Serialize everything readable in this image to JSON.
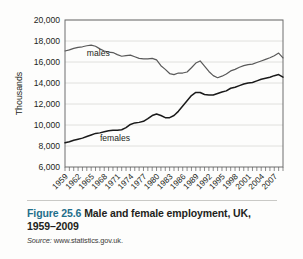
{
  "figure": {
    "number": "Figure 25.6",
    "title": "Male and female employment, UK, 1959–2009",
    "source_label": "Source:",
    "source_value": "www.statistics.gov.uk.",
    "accent_color": "#1f6f8b"
  },
  "chart_data": {
    "type": "line",
    "title": "",
    "xlabel": "",
    "ylabel": "Thousands",
    "ylim": [
      6000,
      20000
    ],
    "ytick_step": 2000,
    "ytick_labels": [
      "6,000",
      "8,000",
      "10,000",
      "12,000",
      "14,000",
      "16,000",
      "18,000",
      "20,000"
    ],
    "ytick_values": [
      6000,
      8000,
      10000,
      12000,
      14000,
      16000,
      18000,
      20000
    ],
    "xlim": [
      1959,
      2009
    ],
    "xtick_labels": [
      "1959",
      "1962",
      "1965",
      "1968",
      "1971",
      "1974",
      "1977",
      "1980",
      "1983",
      "1986",
      "1989",
      "1992",
      "1995",
      "1998",
      "2001",
      "2004",
      "2007"
    ],
    "xtick_values": [
      1959,
      1962,
      1965,
      1968,
      1971,
      1974,
      1977,
      1980,
      1983,
      1986,
      1989,
      1992,
      1995,
      1998,
      2001,
      2004,
      2007
    ],
    "xtick_minor_step": 1,
    "grid": "horizontal",
    "legend": "inline-annotations",
    "annotations": [
      {
        "text": "males",
        "x": 1964,
        "y": 16550
      },
      {
        "text": "females",
        "x": 1967,
        "y": 8450
      }
    ],
    "x": [
      1959,
      1960,
      1961,
      1962,
      1963,
      1964,
      1965,
      1966,
      1967,
      1968,
      1969,
      1970,
      1971,
      1972,
      1973,
      1974,
      1975,
      1976,
      1977,
      1978,
      1979,
      1980,
      1981,
      1982,
      1983,
      1984,
      1985,
      1986,
      1987,
      1988,
      1989,
      1990,
      1991,
      1992,
      1993,
      1994,
      1995,
      1996,
      1997,
      1998,
      1999,
      2000,
      2001,
      2002,
      2003,
      2004,
      2005,
      2006,
      2007,
      2008,
      2009
    ],
    "series": [
      {
        "name": "males",
        "color": "#595959",
        "values": [
          17050,
          17150,
          17300,
          17400,
          17450,
          17550,
          17600,
          17500,
          17250,
          17050,
          16950,
          16900,
          16700,
          16550,
          16600,
          16650,
          16500,
          16350,
          16300,
          16300,
          16350,
          16200,
          15650,
          15300,
          14900,
          14800,
          14950,
          14950,
          15050,
          15450,
          15900,
          16100,
          15600,
          15100,
          14700,
          14500,
          14650,
          14850,
          15150,
          15300,
          15500,
          15650,
          15750,
          15800,
          15950,
          16100,
          16250,
          16400,
          16600,
          16850,
          16400
        ]
      },
      {
        "name": "females",
        "color": "#1a1a1a",
        "values": [
          8300,
          8400,
          8550,
          8650,
          8750,
          8900,
          9050,
          9200,
          9250,
          9350,
          9450,
          9500,
          9500,
          9550,
          9750,
          10050,
          10200,
          10250,
          10350,
          10600,
          10900,
          11050,
          10900,
          10700,
          10700,
          10900,
          11300,
          11800,
          12300,
          12800,
          13100,
          13100,
          12900,
          12850,
          12850,
          13000,
          13150,
          13250,
          13500,
          13600,
          13750,
          13900,
          14000,
          14050,
          14200,
          14350,
          14450,
          14550,
          14700,
          14800,
          14550
        ]
      }
    ]
  }
}
